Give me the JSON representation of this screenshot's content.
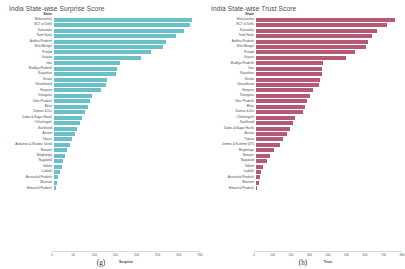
{
  "figure": {
    "panels": [
      {
        "title": "India State-wise Surprise Score",
        "caption": "(g)",
        "column_header": "State",
        "color": "#6BBFC8"
      },
      {
        "title": "India State-wise Trust Score",
        "caption": "(h)",
        "column_header": "State",
        "color": "#B55A75"
      }
    ]
  },
  "chart_data": [
    {
      "type": "bar",
      "orientation": "horizontal",
      "title": "India State-wise Surprise Score",
      "xlabel": "Surprise",
      "ylabel": "State",
      "xlim": [
        0,
        350
      ],
      "xticks": [
        0,
        50,
        100,
        150,
        200,
        250,
        300,
        350
      ],
      "grid": false,
      "legend": false,
      "color": "#6BBFC8",
      "caption": "(g)",
      "categories": [
        "Maharashtra",
        "NCT of Delhi",
        "Karnataka",
        "Tamil Nadu",
        "Andhra Pradesh",
        "West Bengal",
        "Punjab",
        "Gujarat",
        "Goa",
        "Madhya Pradesh",
        "Rajasthan",
        "Kerala",
        "Uttarakhand",
        "Haryana",
        "Telangana",
        "Uttar Pradesh",
        "Bihar",
        "Daman & Diu",
        "Dadra & Nagar Haveli",
        "Chhattisgarh",
        "Jharkhand",
        "Assam",
        "Tripura",
        "Andaman & Nicobar Island",
        "Manipur",
        "Meghalaya",
        "Nagaland",
        "Sikkim",
        "Ladakh",
        "Arunachal Pradesh",
        "Mizoram",
        "Himachal Pradesh"
      ],
      "values": [
        332,
        326,
        312,
        292,
        268,
        262,
        232,
        208,
        158,
        152,
        148,
        128,
        124,
        112,
        92,
        86,
        82,
        74,
        68,
        62,
        56,
        50,
        44,
        38,
        32,
        26,
        22,
        18,
        14,
        10,
        7,
        4
      ]
    },
    {
      "type": "bar",
      "orientation": "horizontal",
      "title": "India State-wise Trust Score",
      "xlabel": "Trust",
      "ylabel": "State",
      "xlim": [
        0,
        800
      ],
      "xticks": [
        0,
        100,
        200,
        300,
        400,
        500,
        600,
        700,
        800
      ],
      "grid": false,
      "legend": false,
      "color": "#B55A75",
      "caption": "(h)",
      "categories": [
        "Maharashtra",
        "NCT of Delhi",
        "Karnataka",
        "Tamil Nadu",
        "Andhra Pradesh",
        "West Bengal",
        "Punjab",
        "Gujarat",
        "Madhya Pradesh",
        "Goa",
        "Rajasthan",
        "Kerala",
        "Uttarakhand",
        "Haryana",
        "Telangana",
        "Uttar Pradesh",
        "Bihar",
        "Daman & Diu",
        "Chhattisgarh",
        "Jharkhand",
        "Dadra & Nagar Haveli",
        "Assam",
        "Tripura",
        "Jammu & Kashmir (UT)",
        "Meghalaya",
        "Manipur",
        "Nagaland",
        "Sikkim",
        "Ladakh",
        "Arunachal Pradesh",
        "Mizoram",
        "Himachal Pradesh"
      ],
      "values": [
        760,
        716,
        664,
        636,
        616,
        600,
        540,
        492,
        368,
        364,
        360,
        352,
        344,
        310,
        296,
        282,
        268,
        256,
        214,
        200,
        186,
        172,
        150,
        130,
        96,
        74,
        58,
        40,
        30,
        22,
        14,
        8
      ]
    }
  ]
}
